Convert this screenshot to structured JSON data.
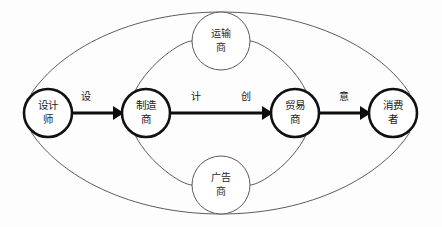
{
  "diagram": {
    "type": "flow-network",
    "background_color": "#fdfdfd",
    "main_stroke_color": "#111111",
    "aux_stroke_color": "#5a5a5a",
    "arrow_color": "#0d0d0d",
    "main_nodes": [
      {
        "id": "designer",
        "label_line1": "设计",
        "label_line2": "师",
        "full_label": "设计师",
        "cx": 48,
        "cy": 113,
        "r": 24
      },
      {
        "id": "manufacturer",
        "label_line1": "制造",
        "label_line2": "商",
        "full_label": "制造商",
        "cx": 146,
        "cy": 113,
        "r": 24
      },
      {
        "id": "trader",
        "label_line1": "贸易",
        "label_line2": "商",
        "full_label": "贸易商",
        "cx": 295,
        "cy": 113,
        "r": 24
      },
      {
        "id": "consumer",
        "label_line1": "消费",
        "label_line2": "者",
        "full_label": "消费者",
        "cx": 393,
        "cy": 113,
        "r": 24
      }
    ],
    "aux_nodes": [
      {
        "id": "transporter",
        "label_line1": "运输",
        "label_line2": "商",
        "full_label": "运输商",
        "cx": 221,
        "cy": 41,
        "r": 29
      },
      {
        "id": "advertiser",
        "label_line1": "广告",
        "label_line2": "商",
        "full_label": "广告商",
        "cx": 221,
        "cy": 185,
        "r": 29
      }
    ],
    "flow_edges": [
      {
        "id": "designer-to-manufacturer",
        "from": "designer",
        "to": "manufacturer",
        "label": "设",
        "label_x": 86,
        "label_y": 98
      },
      {
        "id": "manufacturer-to-trader",
        "from": "manufacturer",
        "to": "trader",
        "label": "计",
        "label_x": 196,
        "label_y": 98
      },
      {
        "id": "manufacturer-to-trader-second",
        "from": "manufacturer",
        "to": "trader",
        "label": "创",
        "label_x": 246,
        "label_y": 98
      },
      {
        "id": "trader-to-consumer",
        "from": "trader",
        "to": "consumer",
        "label": "意",
        "label_x": 344,
        "label_y": 98
      }
    ],
    "curve_links": [
      {
        "id": "designer-to-transporter",
        "from": "designer",
        "to": "transporter"
      },
      {
        "id": "manufacturer-to-transporter",
        "from": "manufacturer",
        "to": "transporter"
      },
      {
        "id": "transporter-to-trader",
        "from": "transporter",
        "to": "trader"
      },
      {
        "id": "transporter-to-consumer",
        "from": "transporter",
        "to": "consumer"
      },
      {
        "id": "designer-to-advertiser",
        "from": "designer",
        "to": "advertiser"
      },
      {
        "id": "manufacturer-to-advertiser",
        "from": "manufacturer",
        "to": "advertiser"
      },
      {
        "id": "advertiser-to-trader",
        "from": "advertiser",
        "to": "trader"
      },
      {
        "id": "advertiser-to-consumer",
        "from": "advertiser",
        "to": "consumer"
      }
    ]
  }
}
